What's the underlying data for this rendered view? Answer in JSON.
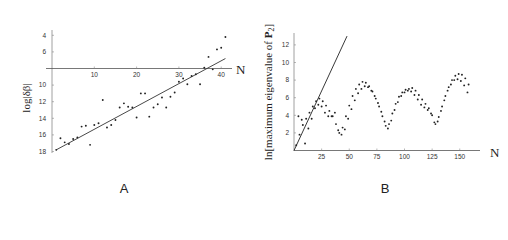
{
  "figure": {
    "panels": [
      "A",
      "B"
    ]
  },
  "chart_data": [
    {
      "type": "scatter",
      "panel_label": "A",
      "title": "",
      "xlabel": "N",
      "ylabel": "log|δβ|",
      "x_ticks": [
        10,
        20,
        30,
        40
      ],
      "y_ticks": [
        -4,
        -6,
        -10,
        -12,
        -14,
        -16,
        -18
      ],
      "y_tick_labels": [
        "4",
        "6",
        "10",
        "12",
        "14",
        "16",
        "18"
      ],
      "x_axis_crosses_at_y": -8,
      "xlim": [
        0,
        42
      ],
      "ylim": [
        -18.5,
        -3.5
      ],
      "grid": false,
      "series": [
        {
          "name": "data",
          "x": [
            1,
            2,
            3,
            4,
            5,
            6,
            7,
            8,
            9,
            10,
            11,
            12,
            13,
            14,
            15,
            16,
            17,
            18,
            19,
            20,
            21,
            22,
            23,
            24,
            25,
            26,
            27,
            28,
            29,
            30,
            31,
            32,
            33,
            34,
            35,
            36,
            37,
            38,
            39,
            40,
            41
          ],
          "y": [
            -17.8,
            -16.4,
            -16.9,
            -17.1,
            -16.5,
            -16.3,
            -15.0,
            -14.9,
            -17.2,
            -14.8,
            -14.6,
            -11.8,
            -15.1,
            -14.8,
            -14.2,
            -12.7,
            -12.2,
            -12.6,
            -12.7,
            -13.9,
            -11.0,
            -11.0,
            -13.8,
            -12.7,
            -12.3,
            -11.5,
            -12.7,
            -11.4,
            -10.9,
            -9.6,
            -9.2,
            -9.9,
            -8.9,
            -8.7,
            -9.9,
            -7.9,
            -6.6,
            -8.1,
            -5.7,
            -5.5,
            -4.2
          ]
        },
        {
          "name": "fit",
          "type": "line",
          "x": [
            1,
            41
          ],
          "y": [
            -17.8,
            -6.8
          ]
        }
      ]
    },
    {
      "type": "scatter",
      "panel_label": "B",
      "title": "",
      "xlabel": "N",
      "ylabel": "ln[maximum eigenvalue of P2]",
      "x_ticks": [
        25,
        50,
        75,
        100,
        125,
        150
      ],
      "y_ticks": [
        2,
        4,
        6,
        8,
        10,
        12
      ],
      "xlim": [
        0,
        160
      ],
      "ylim": [
        0,
        13
      ],
      "grid": false,
      "series": [
        {
          "name": "upper branch",
          "x": [
            2,
            5,
            8,
            11,
            14,
            17,
            20,
            23,
            26,
            29,
            32,
            35,
            38,
            41,
            44,
            47,
            50,
            53,
            56,
            59,
            62,
            65,
            68,
            71,
            74,
            77,
            80,
            83,
            86,
            89,
            92,
            95,
            98,
            101,
            104,
            107,
            110,
            113,
            116,
            119,
            122,
            125,
            128,
            131,
            134,
            137,
            140,
            143,
            146,
            149,
            152,
            155,
            158
          ],
          "y": [
            0.6,
            1.8,
            2.9,
            3.6,
            4.3,
            5.0,
            5.6,
            5.9,
            5.6,
            5.1,
            4.5,
            3.9,
            3.0,
            2.0,
            2.6,
            3.9,
            5.1,
            6.2,
            7.0,
            7.5,
            7.8,
            7.7,
            7.3,
            6.7,
            5.9,
            5.0,
            3.9,
            2.8,
            3.0,
            4.2,
            5.3,
            6.1,
            6.6,
            6.9,
            7.0,
            7.1,
            6.8,
            6.3,
            5.8,
            5.3,
            4.8,
            4.0,
            3.0,
            3.8,
            5.0,
            6.2,
            7.2,
            8.0,
            8.5,
            8.7,
            8.6,
            8.2,
            7.5
          ]
        },
        {
          "name": "lower branch",
          "x": [
            4,
            7,
            10,
            13,
            16,
            19,
            22,
            25,
            28,
            31,
            34,
            37,
            40,
            43,
            46,
            49,
            52,
            55,
            58,
            61,
            64,
            67,
            70,
            73,
            76,
            79,
            82,
            85,
            88,
            91,
            94,
            97,
            100,
            103,
            106,
            109,
            112,
            115,
            118,
            121,
            124,
            127,
            130,
            133,
            136,
            139,
            142,
            145,
            148,
            151,
            154,
            157
          ],
          "y": [
            3.9,
            3.5,
            0.8,
            2.5,
            3.6,
            4.8,
            5.2,
            5.0,
            4.3,
            3.9,
            3.9,
            4.3,
            2.3,
            1.8,
            2.4,
            3.6,
            4.7,
            5.7,
            6.5,
            7.0,
            7.3,
            7.2,
            6.8,
            6.2,
            5.4,
            4.4,
            3.3,
            2.5,
            3.4,
            4.6,
            5.5,
            6.2,
            6.6,
            6.8,
            6.7,
            6.3,
            5.8,
            5.2,
            4.9,
            4.6,
            4.2,
            3.2,
            3.3,
            4.5,
            5.7,
            6.8,
            7.5,
            8.0,
            8.1,
            7.9,
            7.4,
            6.6
          ]
        },
        {
          "name": "line",
          "type": "line",
          "x": [
            0,
            48
          ],
          "y": [
            0,
            13
          ]
        }
      ]
    }
  ]
}
